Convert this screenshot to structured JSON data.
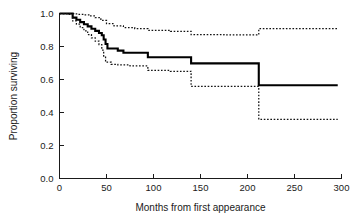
{
  "chart_data": {
    "type": "line",
    "title": "",
    "subtitle": "",
    "xlabel": "Months from first appearance",
    "ylabel": "Proportion surviving",
    "xlim": [
      0,
      300
    ],
    "ylim": [
      0.0,
      1.0
    ],
    "grid": false,
    "legend": null,
    "xticks": [
      0,
      50,
      100,
      150,
      200,
      250,
      300
    ],
    "xtick_labels": [
      "0",
      "50",
      "100",
      "150",
      "200",
      "250",
      "300"
    ],
    "yticks": [
      0.0,
      0.2,
      0.4,
      0.6,
      0.8,
      1.0
    ],
    "ytick_labels": [
      "0.0",
      "0.2",
      "0.4",
      "0.6",
      "0.8",
      "1.0"
    ],
    "annotations": [],
    "series": [
      {
        "name": "Kaplan-Meier survival estimate",
        "style": "solid",
        "step": "post",
        "x": [
          0,
          8,
          14,
          18,
          22,
          26,
          30,
          34,
          38,
          42,
          45,
          47,
          49,
          51,
          62,
          68,
          94,
          140,
          212,
          296
        ],
        "values": [
          1.0,
          1.0,
          0.975,
          0.962,
          0.948,
          0.935,
          0.922,
          0.908,
          0.895,
          0.882,
          0.868,
          0.842,
          0.815,
          0.788,
          0.775,
          0.762,
          0.735,
          0.698,
          0.565,
          0.565
        ]
      },
      {
        "name": "Upper 95% confidence limit",
        "style": "dotted",
        "step": "post",
        "x": [
          0,
          10,
          16,
          20,
          26,
          32,
          38,
          44,
          50,
          58,
          68,
          80,
          94,
          118,
          140,
          175,
          212,
          296
        ],
        "values": [
          1.0,
          1.0,
          0.998,
          0.995,
          0.992,
          0.985,
          0.975,
          0.958,
          0.938,
          0.925,
          0.915,
          0.908,
          0.898,
          0.892,
          0.872,
          0.87,
          0.908,
          0.908
        ]
      },
      {
        "name": "Lower 95% confidence limit",
        "style": "dotted",
        "step": "post",
        "x": [
          0,
          8,
          14,
          18,
          22,
          26,
          30,
          34,
          38,
          42,
          45,
          47,
          49,
          55,
          62,
          75,
          94,
          118,
          140,
          175,
          212,
          296
        ],
        "values": [
          1.0,
          0.995,
          0.955,
          0.935,
          0.915,
          0.895,
          0.872,
          0.852,
          0.832,
          0.812,
          0.778,
          0.742,
          0.705,
          0.692,
          0.688,
          0.682,
          0.655,
          0.65,
          0.558,
          0.558,
          0.358,
          0.358
        ]
      }
    ]
  }
}
